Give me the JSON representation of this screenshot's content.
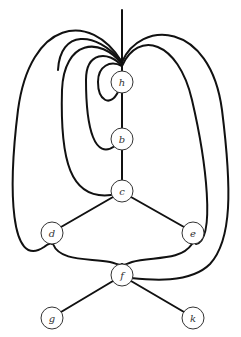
{
  "diagram": {
    "type": "graph",
    "stroke_color": "#111111",
    "node_fill": "#ffffff",
    "node_radius": 11,
    "nodes": [
      {
        "id": "h",
        "label": "h",
        "x": 122,
        "y": 82
      },
      {
        "id": "b",
        "label": "b",
        "x": 122,
        "y": 139
      },
      {
        "id": "c",
        "label": "c",
        "x": 122,
        "y": 191
      },
      {
        "id": "d",
        "label": "d",
        "x": 52,
        "y": 233
      },
      {
        "id": "e",
        "label": "e",
        "x": 193,
        "y": 233
      },
      {
        "id": "f",
        "label": "f",
        "x": 122,
        "y": 275
      },
      {
        "id": "g",
        "label": "g",
        "x": 52,
        "y": 318
      },
      {
        "id": "k",
        "label": "k",
        "x": 193,
        "y": 318
      }
    ],
    "edges": [
      {
        "from": "top",
        "to": "h"
      },
      {
        "from": "h",
        "to": "b"
      },
      {
        "from": "b",
        "to": "c"
      },
      {
        "from": "c",
        "to": "d"
      },
      {
        "from": "c",
        "to": "e"
      },
      {
        "from": "f",
        "to": "g"
      },
      {
        "from": "f",
        "to": "k"
      },
      {
        "from": "top",
        "to": "h",
        "kind": "loop"
      },
      {
        "from": "top",
        "to": "b",
        "kind": "curve"
      },
      {
        "from": "top",
        "to": "c",
        "kind": "curve"
      },
      {
        "from": "top",
        "to": "d",
        "kind": "curve"
      },
      {
        "from": "top",
        "to": "e",
        "kind": "curve"
      },
      {
        "from": "top",
        "to": "f",
        "kind": "curve"
      },
      {
        "from": "d",
        "to": "f",
        "kind": "curve"
      },
      {
        "from": "e",
        "to": "f",
        "kind": "curve"
      }
    ]
  }
}
